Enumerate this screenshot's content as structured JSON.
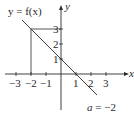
{
  "diagram": {
    "function_label": "y = f(x)",
    "x_axis_label": "x",
    "y_axis_label": "y",
    "annotation": "a = −2",
    "x_ticks": [
      "−3",
      "−2",
      "−1",
      "1",
      "2",
      "3"
    ],
    "y_ticks": [
      "1",
      "2",
      "3"
    ],
    "line": {
      "from": [
        -2.6,
        3.6
      ],
      "to": [
        2.4,
        -1.4
      ]
    },
    "guide_point": [
      -2,
      3
    ],
    "colors": {
      "stroke": "#2a2a2a",
      "background": "#ffffff"
    }
  }
}
